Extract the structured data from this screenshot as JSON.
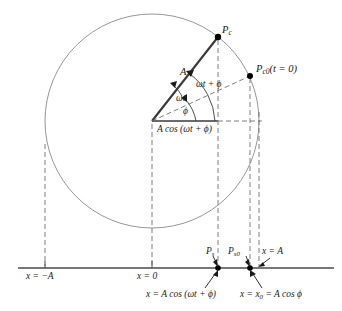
{
  "figure": {
    "type": "physics-diagram",
    "colors": {
      "stroke": "#3a3a3a",
      "dashed": "#6f6f6f",
      "circle": "#7a7a7a",
      "text": "#1a1a1a",
      "point_fill": "#000000",
      "background": "#ffffff"
    }
  },
  "geometry": {
    "center": {
      "x": 152,
      "y": 121
    },
    "radius": 107,
    "baseline_y": 268,
    "angle_total_deg": 52,
    "angle_phi_deg": 23,
    "point_Pc": {
      "x": 218,
      "y": 37
    },
    "point_Pc0": {
      "x": 250,
      "y": 76
    },
    "x_minus_A": 45,
    "x_zero": 152,
    "x_Ps": 218,
    "x_Ps0": 250,
    "x_A": 259
  },
  "labels": {
    "point_c": {
      "symbol": "P",
      "sub": "c"
    },
    "point_c0": {
      "symbol": "P",
      "sub": "c0",
      "suffix": "(t = 0)"
    },
    "point_s": {
      "symbol": "P",
      "sub": "s"
    },
    "point_s0": {
      "symbol": "P",
      "sub": "s0"
    },
    "radius_label": "A",
    "angle_total": "ωt + ϕ",
    "angle_omega_t": "ωt",
    "angle_phi": "ϕ",
    "projection_label": "A cos (ωt + ϕ)",
    "axis_minus_A": "x = −A",
    "axis_zero": "x = 0",
    "axis_A": "x = A",
    "callout_left": "x = A cos (ωt + ϕ)",
    "callout_right": "x = x",
    "callout_right_sub": "0",
    "callout_right_tail": " = A cos ϕ"
  }
}
